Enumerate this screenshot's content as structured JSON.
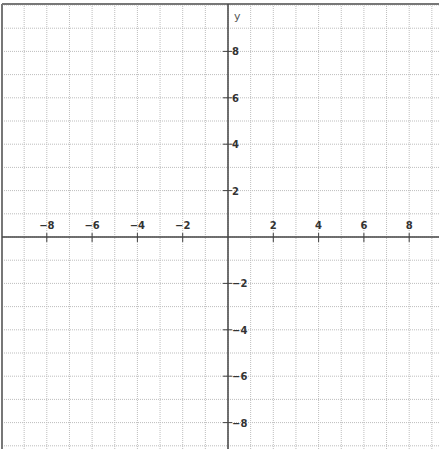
{
  "chart_data": {
    "type": "line",
    "title": "",
    "xlabel": "",
    "ylabel": "y",
    "xlim": [
      -10,
      9.2
    ],
    "ylim": [
      -9,
      10
    ],
    "grid": true,
    "x_ticks": [
      -8,
      -6,
      -4,
      -2,
      2,
      4,
      6,
      8
    ],
    "y_ticks": [
      8,
      6,
      4,
      2,
      -2,
      -4,
      -6,
      -8
    ],
    "x_tick_labels": [
      "−8",
      "−6",
      "−4",
      "−2",
      "2",
      "4",
      "6",
      "8"
    ],
    "y_tick_labels": [
      "8",
      "6",
      "4",
      "2",
      "−2",
      "−4",
      "−6",
      "−8"
    ],
    "series": [],
    "legend": null
  },
  "layout": {
    "origin_px": [
      228,
      237
    ],
    "unit_x_px": 22.65,
    "unit_y_px": 23.2,
    "grid_color": "#bdbdbd",
    "axis_color": "#444444"
  }
}
